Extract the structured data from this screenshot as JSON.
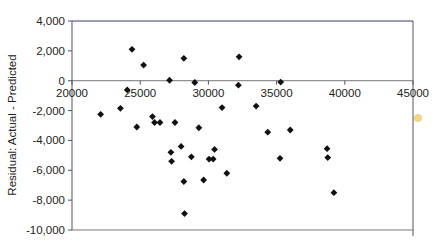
{
  "chart_data": {
    "type": "scatter",
    "title": "",
    "xlabel": "",
    "ylabel": "Residual: Actual - Predicted",
    "xlim": [
      20000,
      45000
    ],
    "ylim": [
      -10000,
      4000
    ],
    "x_ticks": [
      20000,
      25000,
      30000,
      35000,
      40000,
      45000
    ],
    "x_tick_labels": [
      "20000",
      "25000",
      "30000",
      "35000",
      "40000",
      "45000"
    ],
    "y_ticks": [
      4000,
      2000,
      0,
      -2000,
      -4000,
      -6000,
      -8000,
      -10000
    ],
    "y_tick_labels": [
      "4,000",
      "2,000",
      "0",
      "-2,000",
      "-4,000",
      "-6,000",
      "-8,000",
      "-10,000"
    ],
    "grid": false,
    "legend": null,
    "marker": "diamond",
    "marker_color": "#111111",
    "series": [
      {
        "name": "Residuals",
        "points": [
          [
            24400,
            2100
          ],
          [
            25250,
            1050
          ],
          [
            28200,
            1500
          ],
          [
            32250,
            1600
          ],
          [
            27150,
            30
          ],
          [
            29000,
            -120
          ],
          [
            35300,
            -90
          ],
          [
            32200,
            -300
          ],
          [
            24050,
            -620
          ],
          [
            22100,
            -2250
          ],
          [
            23550,
            -1850
          ],
          [
            24750,
            -3100
          ],
          [
            25900,
            -2400
          ],
          [
            26050,
            -2800
          ],
          [
            26450,
            -2800
          ],
          [
            27550,
            -2800
          ],
          [
            29300,
            -3150
          ],
          [
            31000,
            -1800
          ],
          [
            33500,
            -1700
          ],
          [
            34350,
            -3450
          ],
          [
            36000,
            -3300
          ],
          [
            28000,
            -4400
          ],
          [
            27250,
            -4800
          ],
          [
            27300,
            -5400
          ],
          [
            28750,
            -5100
          ],
          [
            30450,
            -4600
          ],
          [
            30050,
            -5250
          ],
          [
            30350,
            -5250
          ],
          [
            31350,
            -6200
          ],
          [
            28200,
            -6750
          ],
          [
            29650,
            -6650
          ],
          [
            28250,
            -8900
          ],
          [
            35250,
            -5200
          ],
          [
            38700,
            -4550
          ],
          [
            38750,
            -5150
          ],
          [
            39200,
            -7500
          ]
        ]
      }
    ]
  },
  "plot": {
    "left": 72,
    "right": 413,
    "top": 21,
    "bottom": 230,
    "zero_line_y": 80,
    "axis_color": "#555555",
    "top_border_color": "#3a3a6a",
    "baseline_color": "#777777"
  }
}
